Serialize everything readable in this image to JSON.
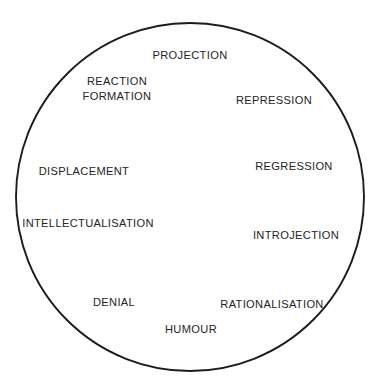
{
  "figure": {
    "name": "defence-mechanisms-wheel",
    "background_color": "#ffffff",
    "line_color": "#1c1c1c",
    "text_color": "#242424",
    "center_x": 190,
    "center_y": 197,
    "radius": 174,
    "sector_count": 10,
    "sector_angle_degrees": 36
  },
  "chart_data": {
    "type": "pie",
    "title": "",
    "xlabel": "",
    "ylabel": "",
    "legend": "none",
    "grid": false,
    "equal_slices": true,
    "categories": [
      "PROJECTION",
      "REPRESSION",
      "REGRESSION",
      "INTROJECTION",
      "RATIONALISATION",
      "HUMOUR",
      "DENIAL",
      "INTELLECTUALISATION",
      "DISPLACEMENT",
      "REACTION FORMATION"
    ],
    "values": [
      10,
      10,
      10,
      10,
      10,
      10,
      10,
      10,
      10,
      10
    ],
    "value_unit": "percent"
  },
  "sectors": [
    {
      "id": "projection",
      "label": "PROJECTION",
      "lines": [
        "PROJECTION"
      ],
      "start_angle": 72,
      "end_angle": 108,
      "label_x": 190,
      "label_y": 56,
      "anchor": "middle"
    },
    {
      "id": "repression",
      "label": "REPRESSION",
      "lines": [
        "REPRESSION"
      ],
      "start_angle": 36,
      "end_angle": 72,
      "label_x": 274,
      "label_y": 101,
      "anchor": "middle"
    },
    {
      "id": "regression",
      "label": "REGRESSION",
      "lines": [
        "REGRESSION"
      ],
      "start_angle": 0,
      "end_angle": 36,
      "label_x": 294,
      "label_y": 167,
      "anchor": "middle"
    },
    {
      "id": "introjection",
      "label": "INTROJECTION",
      "lines": [
        "INTROJECTION"
      ],
      "start_angle": -36,
      "end_angle": 0,
      "label_x": 296,
      "label_y": 236,
      "anchor": "middle"
    },
    {
      "id": "rationalisation",
      "label": "RATIONALISATION",
      "lines": [
        "RATIONALISATION"
      ],
      "start_angle": -72,
      "end_angle": -36,
      "label_x": 272,
      "label_y": 305,
      "anchor": "middle"
    },
    {
      "id": "humour",
      "label": "HUMOUR",
      "lines": [
        "HUMOUR"
      ],
      "start_angle": -108,
      "end_angle": -72,
      "label_x": 191,
      "label_y": 330,
      "anchor": "middle"
    },
    {
      "id": "denial",
      "label": "DENIAL",
      "lines": [
        "DENIAL"
      ],
      "start_angle": -144,
      "end_angle": -108,
      "label_x": 114,
      "label_y": 303,
      "anchor": "middle"
    },
    {
      "id": "intellectualisation",
      "label": "INTELLECTUALISATION",
      "lines": [
        "INTELLECTUALISATION"
      ],
      "start_angle": 180,
      "end_angle": -144,
      "label_x": 88,
      "label_y": 224,
      "anchor": "middle"
    },
    {
      "id": "displacement",
      "label": "DISPLACEMENT",
      "lines": [
        "DISPLACEMENT"
      ],
      "start_angle": 144,
      "end_angle": 180,
      "label_x": 84,
      "label_y": 172,
      "anchor": "middle"
    },
    {
      "id": "reaction-formation",
      "label": "REACTION FORMATION",
      "lines": [
        "REACTION",
        "FORMATION"
      ],
      "start_angle": 108,
      "end_angle": 144,
      "label_x": 117,
      "label_y": 89,
      "anchor": "middle"
    }
  ]
}
